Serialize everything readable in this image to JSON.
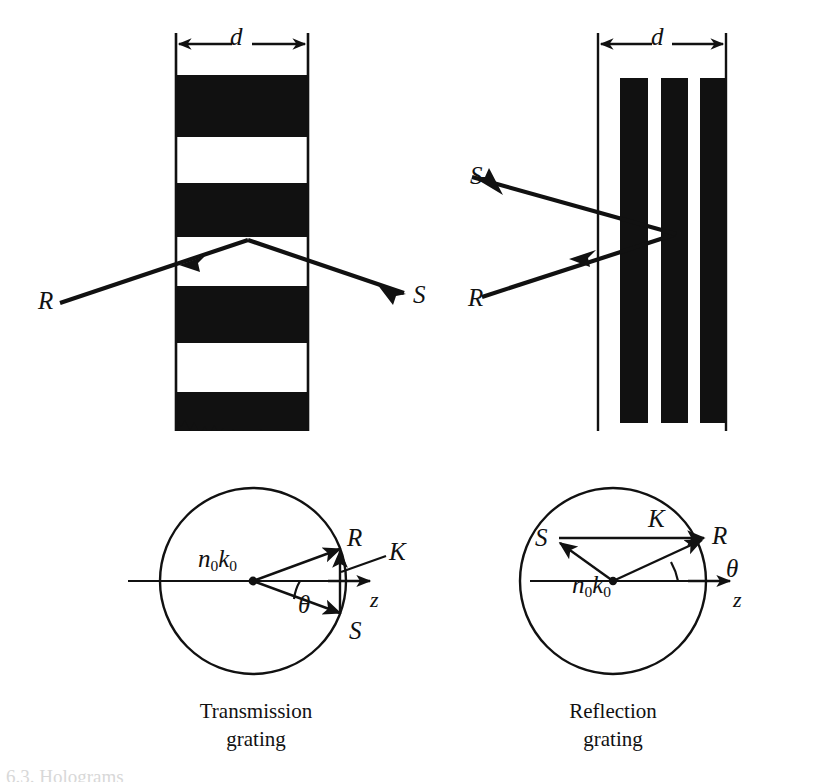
{
  "figure": {
    "title_cut_off": "6.3.  Holograms",
    "background_color": "#ffffff",
    "ink_color": "#111111"
  },
  "panels": {
    "top_left": {
      "name": "transmission-grating-fringes",
      "period_label": "d",
      "incident_beam_label": "R",
      "diffracted_beam_label": "S",
      "fringe_orientation": "horizontal",
      "fringe_count": 4,
      "slab": {
        "x": 176,
        "y": 33,
        "width": 132,
        "height": 398
      }
    },
    "top_right": {
      "name": "reflection-grating-fringes",
      "period_label": "d",
      "incident_beam_label": "R",
      "diffracted_beam_label": "S",
      "fringe_orientation": "vertical",
      "fringe_count": 3,
      "slab": {
        "x": 598,
        "y": 33,
        "width": 128,
        "height": 398
      }
    },
    "bottom_left": {
      "name": "transmission-wavevector-diagram",
      "caption_line1": "Transmission",
      "caption_line2": "grating",
      "radius_label": "n0k0",
      "radius_label_base": "n",
      "reference_vector_label": "R",
      "signal_vector_label": "S",
      "grating_vector_label": "K",
      "angle_label": "θ",
      "axis_label": "z",
      "circle": {
        "cx": 253,
        "cy": 581,
        "r": 93
      }
    },
    "bottom_right": {
      "name": "reflection-wavevector-diagram",
      "caption_line1": "Reflection",
      "caption_line2": "grating",
      "radius_label": "n0k0",
      "reference_vector_label": "R",
      "signal_vector_label": "S",
      "grating_vector_label": "K",
      "angle_label": "θ",
      "axis_label": "z",
      "circle": {
        "cx": 613,
        "cy": 581,
        "r": 93
      }
    }
  },
  "labels": {
    "d_left": "d",
    "d_right": "d",
    "R_top_left": "R",
    "S_top_left": "S",
    "R_top_right": "R",
    "S_top_right": "S",
    "R_bottom_left": "R",
    "S_bottom_left": "S",
    "K_bottom_left": "K",
    "theta_bottom_left": "θ",
    "z_bottom_left": "z",
    "n0k0_bottom_left_n": "n",
    "n0k0_bottom_left_k": "k",
    "sub_zero": "0",
    "R_bottom_right": "R",
    "S_bottom_right": "S",
    "K_bottom_right": "K",
    "theta_bottom_right": "θ",
    "z_bottom_right": "z",
    "caption_left_line1": "Transmission",
    "caption_left_line2": "grating",
    "caption_right_line1": "Reflection",
    "caption_right_line2": "grating"
  }
}
